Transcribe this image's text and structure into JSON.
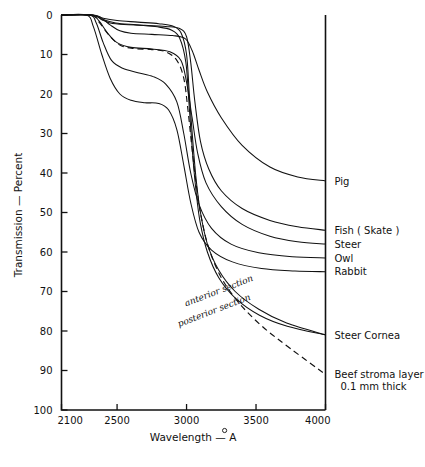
{
  "chart_data": {
    "type": "line",
    "title": "",
    "xlabel": "Wavelength — Å",
    "ylabel": "Transmission — Percent",
    "xlim": [
      2100,
      4000
    ],
    "ylim": [
      0,
      100
    ],
    "y_inverted": true,
    "grid": false,
    "legend_position": "right-inline",
    "xticks": [
      2100,
      2500,
      3000,
      3500,
      4000
    ],
    "xtick_labels": [
      "2100",
      "2500",
      "3000",
      "3500",
      "4000"
    ],
    "yticks": [
      0,
      10,
      20,
      30,
      40,
      50,
      60,
      70,
      80,
      90,
      100
    ],
    "ytick_labels": [
      "0",
      "10",
      "20",
      "30",
      "40",
      "50",
      "60",
      "70",
      "80",
      "90",
      "100"
    ],
    "annotations": [
      {
        "text": "anterior  section",
        "rotation": -22
      },
      {
        "text": "posterior  section",
        "rotation": -22
      }
    ],
    "series": [
      {
        "name": "Pig",
        "style": "solid",
        "label": "Pig",
        "label_value": 42,
        "points": [
          [
            2100,
            0
          ],
          [
            2300,
            0
          ],
          [
            2380,
            0.6
          ],
          [
            2450,
            2.5
          ],
          [
            2520,
            4.0
          ],
          [
            2600,
            4.6
          ],
          [
            2750,
            4.9
          ],
          [
            2900,
            5.2
          ],
          [
            2990,
            6.0
          ],
          [
            3040,
            9.0
          ],
          [
            3090,
            14.0
          ],
          [
            3150,
            19.5
          ],
          [
            3250,
            26.0
          ],
          [
            3400,
            33.0
          ],
          [
            3600,
            38.5
          ],
          [
            3800,
            41.0
          ],
          [
            4000,
            42.0
          ]
        ]
      },
      {
        "name": "Fish ( Skate )",
        "style": "solid",
        "label": "Fish ( Skate )",
        "label_value": 54.5,
        "points": [
          [
            2100,
            0
          ],
          [
            2320,
            0
          ],
          [
            2390,
            1.2
          ],
          [
            2450,
            2.0
          ],
          [
            2550,
            2.4
          ],
          [
            2700,
            2.6
          ],
          [
            2850,
            2.9
          ],
          [
            2950,
            3.4
          ],
          [
            3000,
            5.5
          ],
          [
            3030,
            12.0
          ],
          [
            3060,
            22.0
          ],
          [
            3100,
            32.0
          ],
          [
            3160,
            39.0
          ],
          [
            3250,
            44.5
          ],
          [
            3400,
            49.0
          ],
          [
            3600,
            52.0
          ],
          [
            3800,
            53.6
          ],
          [
            4000,
            54.5
          ]
        ]
      },
      {
        "name": "Steer",
        "style": "solid",
        "label": "Steer",
        "label_value": 58,
        "points": [
          [
            2100,
            0
          ],
          [
            2310,
            0
          ],
          [
            2370,
            1.5
          ],
          [
            2430,
            4.5
          ],
          [
            2500,
            7.0
          ],
          [
            2600,
            8.2
          ],
          [
            2750,
            8.6
          ],
          [
            2880,
            9.3
          ],
          [
            2960,
            11.5
          ],
          [
            3000,
            17.0
          ],
          [
            3040,
            26.0
          ],
          [
            3080,
            35.0
          ],
          [
            3140,
            42.5
          ],
          [
            3250,
            48.5
          ],
          [
            3400,
            53.0
          ],
          [
            3600,
            56.0
          ],
          [
            3800,
            57.4
          ],
          [
            4000,
            58.0
          ]
        ]
      },
      {
        "name": "Owl",
        "style": "solid",
        "label": "Owl",
        "label_value": 61.5,
        "points": [
          [
            2100,
            0
          ],
          [
            2300,
            0
          ],
          [
            2350,
            2.0
          ],
          [
            2400,
            7.0
          ],
          [
            2460,
            11.5
          ],
          [
            2540,
            13.5
          ],
          [
            2650,
            14.6
          ],
          [
            2760,
            15.6
          ],
          [
            2850,
            17.5
          ],
          [
            2930,
            22.0
          ],
          [
            2980,
            30.0
          ],
          [
            3030,
            40.0
          ],
          [
            3090,
            48.0
          ],
          [
            3180,
            54.0
          ],
          [
            3320,
            58.0
          ],
          [
            3520,
            60.2
          ],
          [
            3760,
            61.2
          ],
          [
            4000,
            61.5
          ]
        ]
      },
      {
        "name": "Rabbit",
        "style": "solid",
        "label": "Rabbit",
        "label_value": 65,
        "points": [
          [
            2100,
            0
          ],
          [
            2280,
            0
          ],
          [
            2330,
            3.0
          ],
          [
            2390,
            10.0
          ],
          [
            2450,
            16.0
          ],
          [
            2520,
            20.0
          ],
          [
            2600,
            21.6
          ],
          [
            2700,
            22.2
          ],
          [
            2800,
            22.4
          ],
          [
            2870,
            24.0
          ],
          [
            2930,
            29.0
          ],
          [
            2980,
            38.0
          ],
          [
            3030,
            47.5
          ],
          [
            3090,
            55.0
          ],
          [
            3180,
            59.5
          ],
          [
            3330,
            62.5
          ],
          [
            3540,
            64.2
          ],
          [
            3780,
            64.8
          ],
          [
            4000,
            65.0
          ]
        ]
      },
      {
        "name": "Steer Cornea — anterior section",
        "style": "solid",
        "label": "Steer Cornea",
        "label_value": 81,
        "points": [
          [
            2100,
            0
          ],
          [
            2330,
            0
          ],
          [
            2400,
            0.8
          ],
          [
            2500,
            1.4
          ],
          [
            2650,
            1.8
          ],
          [
            2800,
            2.2
          ],
          [
            2900,
            2.8
          ],
          [
            2960,
            4.5
          ],
          [
            3000,
            10.0
          ],
          [
            3020,
            20.0
          ],
          [
            3045,
            32.0
          ],
          [
            3070,
            42.0
          ],
          [
            3100,
            50.0
          ],
          [
            3150,
            58.0
          ],
          [
            3230,
            64.5
          ],
          [
            3350,
            70.0
          ],
          [
            3520,
            74.5
          ],
          [
            3720,
            78.0
          ],
          [
            4000,
            81.0
          ]
        ]
      },
      {
        "name": "Steer Cornea — posterior section",
        "style": "solid",
        "label": "",
        "label_value": 81,
        "points": [
          [
            2100,
            0
          ],
          [
            2325,
            0
          ],
          [
            2395,
            1.1
          ],
          [
            2490,
            2.0
          ],
          [
            2640,
            2.5
          ],
          [
            2790,
            3.0
          ],
          [
            2890,
            3.8
          ],
          [
            2950,
            5.8
          ],
          [
            2995,
            12.0
          ],
          [
            3018,
            22.5
          ],
          [
            3042,
            34.5
          ],
          [
            3068,
            44.5
          ],
          [
            3098,
            52.5
          ],
          [
            3150,
            60.0
          ],
          [
            3232,
            66.5
          ],
          [
            3355,
            71.8
          ],
          [
            3525,
            76.0
          ],
          [
            3725,
            78.8
          ],
          [
            4000,
            81.0
          ]
        ]
      },
      {
        "name": "Beef stroma layer 0.1 mm thick",
        "style": "dashed",
        "label": "Beef stroma layer",
        "label_line2": "0.1 mm thick",
        "label_value": 91,
        "points": [
          [
            2100,
            0
          ],
          [
            2310,
            0
          ],
          [
            2370,
            1.8
          ],
          [
            2440,
            5.0
          ],
          [
            2520,
            7.6
          ],
          [
            2620,
            8.5
          ],
          [
            2740,
            8.7
          ],
          [
            2850,
            9.3
          ],
          [
            2930,
            11.5
          ],
          [
            2980,
            16.0
          ],
          [
            3010,
            24.0
          ],
          [
            3040,
            34.0
          ],
          [
            3070,
            43.0
          ],
          [
            3105,
            51.0
          ],
          [
            3160,
            59.0
          ],
          [
            3250,
            66.5
          ],
          [
            3380,
            73.0
          ],
          [
            3550,
            79.0
          ],
          [
            3750,
            84.5
          ],
          [
            4000,
            91.0
          ]
        ]
      }
    ]
  },
  "labels": {
    "y_axis_title": "Transmission — Percent",
    "x_axis_title": "Wavelength — Å",
    "series_right": [
      {
        "text": "Pig"
      },
      {
        "text": "Fish ( Skate )"
      },
      {
        "text": "Steer"
      },
      {
        "text": "Owl"
      },
      {
        "text": "Rabbit"
      },
      {
        "text": "Steer Cornea"
      },
      {
        "text": "Beef stroma layer"
      },
      {
        "text": "0.1 mm thick"
      }
    ],
    "inline": [
      {
        "text": "anterior  section"
      },
      {
        "text": "posterior  section"
      }
    ]
  },
  "colors": {
    "ink": "#111111",
    "background": "#ffffff"
  }
}
